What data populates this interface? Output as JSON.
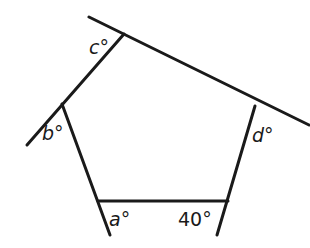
{
  "diagram": {
    "type": "pentagon with exterior angles",
    "labels": {
      "a": "a°",
      "b": "b°",
      "c": "c°",
      "d": "d°",
      "known": "40°"
    },
    "colors": {
      "stroke": "#1a1a1a",
      "background": "#ffffff"
    }
  }
}
